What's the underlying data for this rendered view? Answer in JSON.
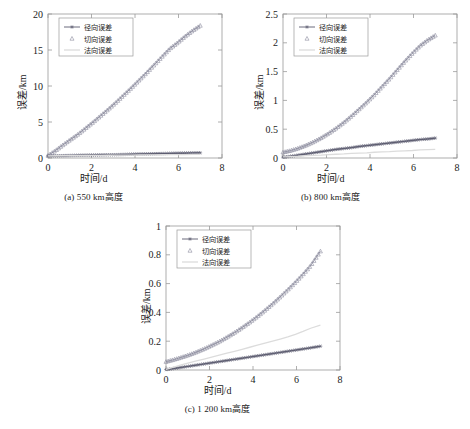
{
  "figure": {
    "legend_labels": {
      "radial": "径向误差",
      "tangential": "切向误差",
      "normal": "法向误差"
    },
    "axis": {
      "xlabel": "时间/d",
      "ylabel": "误差/km"
    },
    "captions": {
      "a": "(a) 550 km高度",
      "b": "(b) 800 km高度",
      "c": "(c) 1 200 km高度"
    },
    "colors": {
      "radial": "#5a5a6e",
      "tangential": "#8c8c9e",
      "normal": "#dcdcdc",
      "axis": "#9a9a9a",
      "text": "#1a1a1a"
    }
  },
  "chart_data": [
    {
      "id": "a",
      "type": "line",
      "title": "(a) 550 km高度",
      "xlabel": "时间/d",
      "ylabel": "误差/km",
      "xlim": [
        0,
        8
      ],
      "ylim": [
        0,
        20
      ],
      "xticks": [
        0,
        2,
        4,
        6,
        8
      ],
      "yticks": [
        0,
        5,
        10,
        15,
        20
      ],
      "grid": false,
      "legend_position": "upper-left",
      "x": [
        0,
        0.35,
        0.7,
        1.05,
        1.4,
        1.75,
        2.1,
        2.45,
        2.8,
        3.15,
        3.5,
        3.85,
        4.2,
        4.55,
        4.9,
        5.25,
        5.6,
        5.95,
        6.3,
        6.65,
        7.0
      ],
      "series": [
        {
          "name": "径向误差",
          "marker": "star",
          "values": [
            0.3,
            0.31,
            0.33,
            0.35,
            0.37,
            0.39,
            0.41,
            0.43,
            0.45,
            0.47,
            0.49,
            0.52,
            0.55,
            0.57,
            0.6,
            0.62,
            0.64,
            0.66,
            0.68,
            0.7,
            0.72
          ]
        },
        {
          "name": "切向误差",
          "marker": "triangle",
          "values": [
            0.35,
            1.05,
            1.85,
            2.6,
            3.35,
            4.2,
            5.05,
            5.95,
            6.85,
            7.8,
            8.8,
            9.8,
            10.85,
            11.9,
            13.0,
            14.1,
            15.2,
            16.0,
            16.9,
            17.7,
            18.4
          ]
        },
        {
          "name": "法向误差",
          "marker": "none",
          "values": [
            0.3,
            0.31,
            0.32,
            0.33,
            0.34,
            0.35,
            0.36,
            0.37,
            0.38,
            0.39,
            0.4,
            0.41,
            0.42,
            0.43,
            0.44,
            0.45,
            0.46,
            0.47,
            0.48,
            0.49,
            0.5
          ]
        }
      ]
    },
    {
      "id": "b",
      "type": "line",
      "title": "(b) 800 km高度",
      "xlabel": "时间/d",
      "ylabel": "误差/km",
      "xlim": [
        0,
        8
      ],
      "ylim": [
        0,
        2.5
      ],
      "xticks": [
        0,
        2,
        4,
        6,
        8
      ],
      "yticks": [
        0,
        0.5,
        1,
        1.5,
        2,
        2.5
      ],
      "grid": false,
      "legend_position": "upper-left",
      "x": [
        0,
        0.35,
        0.7,
        1.05,
        1.4,
        1.75,
        2.1,
        2.45,
        2.8,
        3.15,
        3.5,
        3.85,
        4.2,
        4.55,
        4.9,
        5.25,
        5.6,
        5.95,
        6.3,
        6.65,
        7.0
      ],
      "series": [
        {
          "name": "径向误差",
          "marker": "star",
          "values": [
            0.015,
            0.03,
            0.05,
            0.07,
            0.09,
            0.11,
            0.13,
            0.15,
            0.165,
            0.18,
            0.2,
            0.215,
            0.23,
            0.245,
            0.26,
            0.275,
            0.29,
            0.305,
            0.32,
            0.33,
            0.345
          ]
        },
        {
          "name": "切向误差",
          "marker": "triangle",
          "values": [
            0.1,
            0.13,
            0.17,
            0.22,
            0.28,
            0.35,
            0.43,
            0.52,
            0.62,
            0.73,
            0.85,
            0.97,
            1.1,
            1.24,
            1.38,
            1.53,
            1.68,
            1.82,
            1.95,
            2.05,
            2.13
          ]
        },
        {
          "name": "法向误差",
          "marker": "none",
          "values": [
            0.02,
            0.025,
            0.03,
            0.04,
            0.045,
            0.05,
            0.06,
            0.065,
            0.07,
            0.08,
            0.085,
            0.09,
            0.1,
            0.105,
            0.11,
            0.12,
            0.125,
            0.13,
            0.14,
            0.145,
            0.15
          ]
        }
      ]
    },
    {
      "id": "c",
      "type": "line",
      "title": "(c) 1 200 km高度",
      "xlabel": "时间/d",
      "ylabel": "误差/km",
      "xlim": [
        0,
        8
      ],
      "ylim": [
        0,
        1
      ],
      "xticks": [
        0,
        2,
        4,
        6,
        8
      ],
      "yticks": [
        0,
        0.2,
        0.4,
        0.6,
        0.8,
        1
      ],
      "grid": false,
      "legend_position": "upper-left",
      "x": [
        0,
        0.35,
        0.7,
        1.05,
        1.4,
        1.75,
        2.1,
        2.45,
        2.8,
        3.15,
        3.5,
        3.85,
        4.2,
        4.55,
        4.9,
        5.25,
        5.6,
        5.95,
        6.3,
        6.65,
        7.1
      ],
      "series": [
        {
          "name": "径向误差",
          "marker": "star",
          "values": [
            0.003,
            0.01,
            0.018,
            0.026,
            0.034,
            0.042,
            0.05,
            0.058,
            0.066,
            0.074,
            0.082,
            0.09,
            0.098,
            0.106,
            0.114,
            0.122,
            0.13,
            0.138,
            0.146,
            0.154,
            0.165
          ]
        },
        {
          "name": "切向误差",
          "marker": "triangle",
          "values": [
            0.058,
            0.072,
            0.088,
            0.105,
            0.125,
            0.147,
            0.172,
            0.198,
            0.228,
            0.26,
            0.295,
            0.332,
            0.372,
            0.415,
            0.46,
            0.508,
            0.558,
            0.61,
            0.665,
            0.725,
            0.825
          ]
        },
        {
          "name": "法向误差",
          "marker": "none",
          "values": [
            0.005,
            0.02,
            0.035,
            0.05,
            0.063,
            0.076,
            0.09,
            0.103,
            0.117,
            0.13,
            0.144,
            0.158,
            0.172,
            0.186,
            0.2,
            0.215,
            0.23,
            0.248,
            0.268,
            0.29,
            0.312
          ]
        }
      ]
    }
  ]
}
